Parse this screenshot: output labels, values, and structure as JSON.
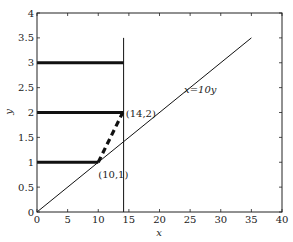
{
  "chart_data": {
    "type": "line",
    "title": "",
    "xlabel": "x",
    "ylabel": "y",
    "xlim": [
      0,
      40
    ],
    "ylim": [
      0,
      4
    ],
    "grid": false,
    "legend": null,
    "x_ticks": [
      "0",
      "5",
      "10",
      "15",
      "20",
      "25",
      "30",
      "35",
      "40"
    ],
    "y_ticks": [
      "0",
      "0.5",
      "1",
      "1.5",
      "2",
      "2.5",
      "3",
      "3.5",
      "4"
    ],
    "series": [
      {
        "name": "x=10y",
        "style": "thin solid",
        "points": [
          [
            0,
            0
          ],
          [
            35,
            3.5
          ]
        ]
      },
      {
        "name": "vertical line",
        "style": "thin solid",
        "points": [
          [
            14.14,
            0
          ],
          [
            14.14,
            3.5
          ]
        ]
      },
      {
        "name": "level y=1",
        "style": "thick solid",
        "points": [
          [
            0,
            1
          ],
          [
            10,
            1
          ]
        ]
      },
      {
        "name": "level y=2",
        "style": "thick solid",
        "points": [
          [
            0,
            2
          ],
          [
            14.14,
            2
          ]
        ]
      },
      {
        "name": "level y=3",
        "style": "thick solid",
        "points": [
          [
            0,
            3
          ],
          [
            14.14,
            3
          ]
        ]
      },
      {
        "name": "path (10,1)-(14,2)",
        "style": "thick dashed",
        "points": [
          [
            10,
            1
          ],
          [
            14,
            2
          ]
        ]
      }
    ],
    "annotations": [
      {
        "text": "(14,2)",
        "x": 14,
        "y": 2
      },
      {
        "text": "(10,1)",
        "x": 10,
        "y": 1
      },
      {
        "text": "x=10y",
        "x": 24,
        "y": 2.4
      }
    ]
  }
}
